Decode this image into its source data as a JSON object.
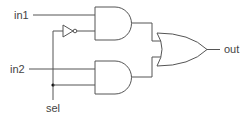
{
  "diagram": {
    "type": "logic-circuit",
    "inputs": [
      {
        "id": "in1",
        "label": "in1"
      },
      {
        "id": "in2",
        "label": "in2"
      },
      {
        "id": "sel",
        "label": "sel"
      }
    ],
    "outputs": [
      {
        "id": "out",
        "label": "out"
      }
    ],
    "gates": [
      {
        "id": "not1",
        "type": "NOT",
        "inputs": [
          "sel"
        ]
      },
      {
        "id": "and1",
        "type": "AND",
        "inputs": [
          "in1",
          "not1"
        ]
      },
      {
        "id": "and2",
        "type": "AND",
        "inputs": [
          "in2",
          "sel"
        ]
      },
      {
        "id": "or1",
        "type": "OR",
        "inputs": [
          "and1",
          "and2"
        ],
        "output": "out"
      }
    ],
    "colors": {
      "wire": "#555555",
      "junction": "#111111",
      "text": "#444444"
    }
  }
}
